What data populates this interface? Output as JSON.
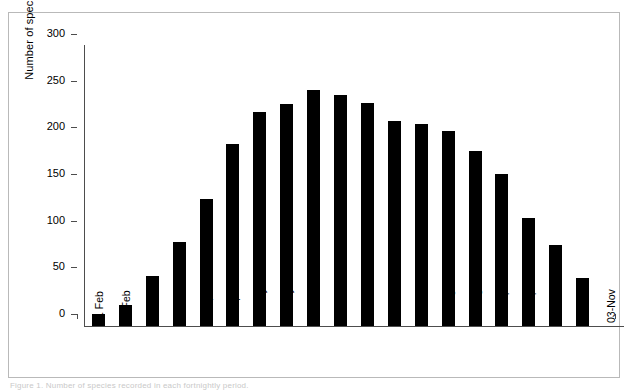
{
  "figure": {
    "caption": "Figure 1. Number of species recorded in each fortnightly period."
  },
  "chart_data": {
    "type": "bar",
    "title": "",
    "xlabel": "",
    "ylabel": "Number of species",
    "ylim": [
      0,
      300
    ],
    "yticks": [
      0,
      50,
      100,
      150,
      200,
      250,
      300
    ],
    "ytick_labels": [
      "0",
      "50",
      "100",
      "150",
      "200",
      "250",
      "300"
    ],
    "grid": false,
    "legend": null,
    "bar_color": "#000000",
    "background_color": "#ffffff",
    "axis_color": "#4d4d4d",
    "categories": [
      "11 Feb",
      "25 Feb",
      "10-Mar",
      "24-Mar",
      "07-Apr",
      "21-Apr",
      "05-May",
      "19-May",
      "02-Jun",
      "16-Jun",
      "30-Jun",
      "14-Jul",
      "28-Jul",
      "11-Aug",
      "25-Aug",
      "08-Sep",
      "22-Sep",
      "06-Oct",
      "20-Oct",
      "03-Nov"
    ],
    "values": [
      13,
      22,
      54,
      90,
      136,
      195,
      229,
      238,
      253,
      247,
      239,
      220,
      216,
      209,
      187,
      163,
      116,
      87,
      51,
      null
    ]
  }
}
